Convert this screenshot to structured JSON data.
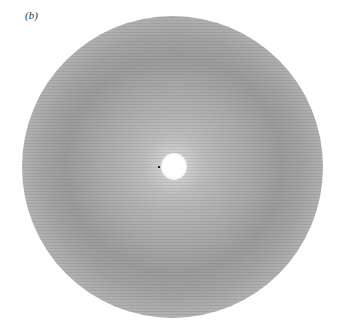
{
  "figure": {
    "panel_label": "(b)",
    "image_description": "circular diffraction pattern with bright central spot and diffuse concentric rings"
  }
}
